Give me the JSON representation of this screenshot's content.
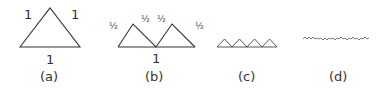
{
  "figure": {
    "panels": [
      {
        "id": "a",
        "caption": "(a)",
        "description": "single equilateral triangle",
        "labels": {
          "left_side": "1",
          "right_side": "1",
          "base": "1"
        }
      },
      {
        "id": "b",
        "caption": "(b)",
        "description": "two half-size triangles on a base of length 1",
        "labels": {
          "side_1": "½",
          "side_2": "½",
          "side_3": "½",
          "side_4": "½",
          "base": "1"
        }
      },
      {
        "id": "c",
        "caption": "(c)",
        "description": "four quarter-size triangles"
      },
      {
        "id": "d",
        "caption": "(d)",
        "description": "many tiny triangles forming a wiggly line"
      }
    ],
    "stroke_color": "#333333"
  }
}
